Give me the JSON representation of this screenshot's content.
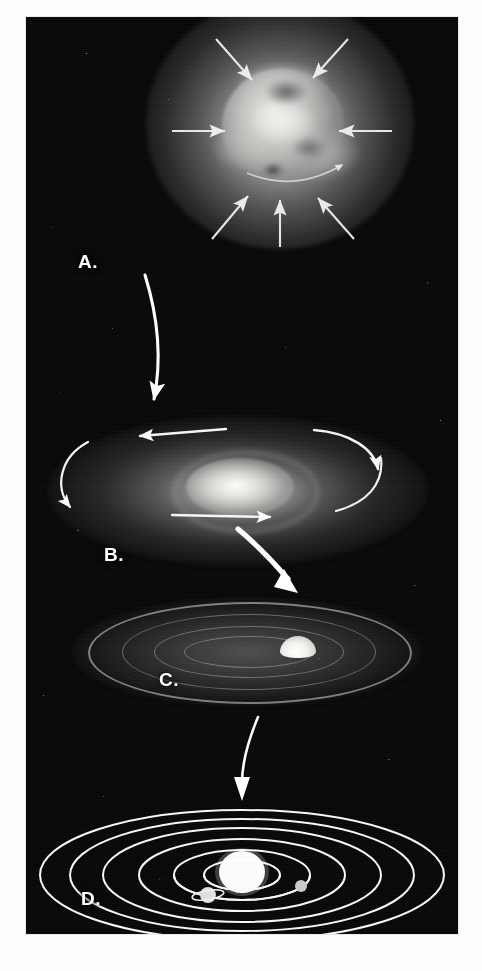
{
  "figure": {
    "medium": "halftone photographic illustration",
    "background_color": "#070709",
    "ink_color": "#ffffff",
    "plate": {
      "x": 26,
      "y": 17,
      "width": 432,
      "height": 917
    }
  },
  "stages": [
    {
      "id": "a",
      "label": "A.",
      "name": "collapsing-interstellar-cloud",
      "caption": "Slowly rotating interstellar gas and dust cloud contracting under its own gravity",
      "center": {
        "x": 254,
        "y": 108
      },
      "infall_arrow_count": 7
    },
    {
      "id": "b",
      "label": "B.",
      "name": "flattened-rotating-disk",
      "caption": "Cloud spins faster and flattens into a rotating disk with a hot condensing center",
      "center": {
        "x": 212,
        "y": 75
      },
      "rotation_arrow_count": 4,
      "rotation_direction": "counterclockwise"
    },
    {
      "id": "c",
      "label": "C.",
      "name": "planetesimal-disk",
      "caption": "Dust grains accrete into planetesimals in rings around the newly formed protosun",
      "center": {
        "x": 222,
        "y": 60
      },
      "ring_count": 4
    },
    {
      "id": "d",
      "label": "D.",
      "name": "formed-solar-system",
      "caption": "Planets sweep their orbits clear, leaving the present-day solar system",
      "center": {
        "x": 216,
        "y": 83
      },
      "orbit_count": 6
    }
  ],
  "arrows": {
    "infall": [
      {
        "name": "infall-arrow-top-left",
        "x1": 190,
        "y1": 22,
        "x2": 225,
        "y2": 62
      },
      {
        "name": "infall-arrow-top-right",
        "x1": 322,
        "y1": 22,
        "x2": 288,
        "y2": 60
      },
      {
        "name": "infall-arrow-left",
        "x1": 146,
        "y1": 114,
        "x2": 198,
        "y2": 114
      },
      {
        "name": "infall-arrow-right",
        "x1": 366,
        "y1": 114,
        "x2": 314,
        "y2": 114
      },
      {
        "name": "infall-arrow-bottom-left",
        "x1": 186,
        "y1": 222,
        "x2": 221,
        "y2": 178
      },
      {
        "name": "infall-arrow-bottom",
        "x1": 254,
        "y1": 228,
        "x2": 254,
        "y2": 182
      },
      {
        "name": "infall-arrow-bottom-right",
        "x1": 328,
        "y1": 222,
        "x2": 292,
        "y2": 180
      }
    ],
    "rotation": [
      {
        "name": "rotation-arrow-top",
        "direction": "left"
      },
      {
        "name": "rotation-arrow-right",
        "direction": "down"
      },
      {
        "name": "rotation-arrow-bottom",
        "direction": "right"
      },
      {
        "name": "rotation-arrow-left",
        "direction": "down"
      }
    ],
    "transitions": [
      {
        "name": "transition-arrow-a-to-b",
        "from": "A.",
        "to": "B.",
        "style": "thin-curved"
      },
      {
        "name": "transition-arrow-b-to-c",
        "from": "B.",
        "to": "C.",
        "style": "thick-curved"
      },
      {
        "name": "transition-arrow-c-to-d",
        "from": "C.",
        "to": "D.",
        "style": "thin-curved"
      }
    ]
  },
  "solar_system": {
    "sun": {
      "name": "sun",
      "cx": 216,
      "cy": 81,
      "rx": 23,
      "ry": 21
    },
    "orbits": [
      {
        "name": "orbit-1",
        "cx": 216,
        "cy": 83,
        "rx": 38,
        "ry": 15
      },
      {
        "name": "orbit-2",
        "cx": 216,
        "cy": 83,
        "rx": 68,
        "ry": 25
      },
      {
        "name": "orbit-3",
        "cx": 216,
        "cy": 83,
        "rx": 103,
        "ry": 36
      },
      {
        "name": "orbit-4",
        "cx": 216,
        "cy": 83,
        "rx": 139,
        "ry": 47
      },
      {
        "name": "orbit-5",
        "cx": 216,
        "cy": 83,
        "rx": 172,
        "ry": 56
      },
      {
        "name": "orbit-6",
        "cx": 216,
        "cy": 83,
        "rx": 202,
        "ry": 65
      }
    ],
    "planets": [
      {
        "name": "planet-inner-right",
        "cx": 275,
        "cy": 94,
        "r": 6,
        "has_ring": false
      },
      {
        "name": "planet-ringed",
        "cx": 182,
        "cy": 103,
        "r": 8,
        "has_ring": true
      }
    ]
  }
}
